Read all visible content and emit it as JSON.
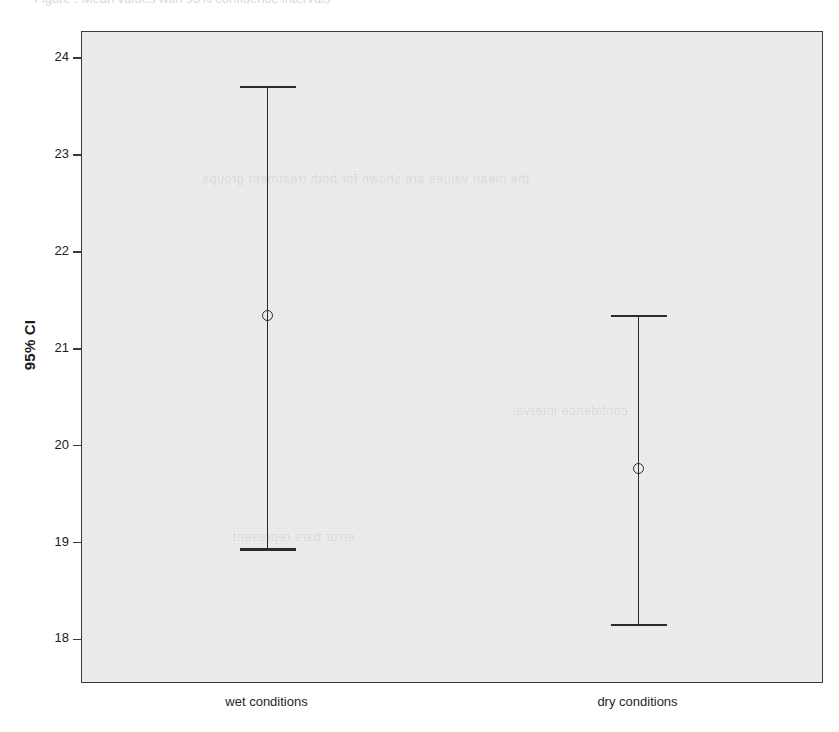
{
  "page": {
    "top_sliver_text": "Figure . Mean values with 95% confidence intervals"
  },
  "chart_data": {
    "type": "scatter",
    "title": "",
    "subtitle": "",
    "xlabel": "",
    "ylabel": "95% CI",
    "categories": [
      "wet conditions",
      "dry conditions"
    ],
    "ylim": [
      17.55,
      24.28
    ],
    "y_ticks": [
      18,
      19,
      20,
      21,
      22,
      23,
      24
    ],
    "y_tick_labels": [
      "18",
      "19",
      "20",
      "21",
      "22",
      "23",
      "24"
    ],
    "grid": false,
    "legend": false,
    "legend_position": "none",
    "error_bar_style": "mean with 95% confidence interval, open circle marker, T-caps",
    "series": [
      {
        "name": "95% CI",
        "points": [
          {
            "category": "wet conditions",
            "mean": 21.35,
            "lower": 18.95,
            "upper": 23.72
          },
          {
            "category": "dry conditions",
            "mean": 19.77,
            "lower": 18.17,
            "upper": 21.36
          }
        ]
      }
    ],
    "colors": {
      "plot_background": "#ececec",
      "page_background": "#ffffff",
      "axis_line": "#3a3a3a",
      "marker": "#2b2b2b",
      "text": "#1f1f1f"
    }
  },
  "ghost_text": [
    "the mean values are shown for both treatment groups",
    "confidence interval",
    "error bars represent"
  ]
}
